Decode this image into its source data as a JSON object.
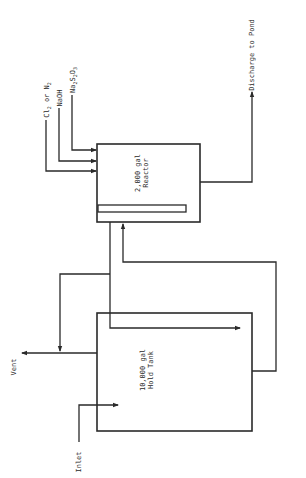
{
  "diagram": {
    "type": "process-flow",
    "orientation": "rotated-90-ccw",
    "line_color": "#2a2a2a",
    "background": "#ffffff",
    "units": {
      "reactor": {
        "label_line1": "2,000 gal",
        "label_line2": "Reactor"
      },
      "hold_tank": {
        "label_line1": "10,000 gal",
        "label_line2": "Hold Tank"
      }
    },
    "streams": {
      "inlet": "Inlet",
      "vent": "Vent",
      "discharge": "Discharge to Pond",
      "chem1": {
        "main": "Cl",
        "sub": "2",
        "mid": " or N",
        "sub2": "2"
      },
      "chem2": "NaOH",
      "chem3": {
        "p1": "Na",
        "s1": "2",
        "p2": "S",
        "s2": "2",
        "p3": "O",
        "s3": "3"
      }
    }
  }
}
